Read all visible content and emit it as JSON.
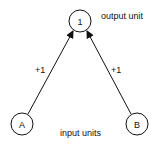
{
  "diagram": {
    "nodes": [
      {
        "id": "output",
        "label": "1",
        "role": "output unit"
      },
      {
        "id": "A",
        "label": "A",
        "role": "input unit"
      },
      {
        "id": "B",
        "label": "B",
        "role": "input unit"
      }
    ],
    "edges": [
      {
        "from": "A",
        "to": "output",
        "weight": "+1"
      },
      {
        "from": "B",
        "to": "output",
        "weight": "+1"
      }
    ],
    "labels": {
      "output": "output unit",
      "input": "input units"
    }
  }
}
